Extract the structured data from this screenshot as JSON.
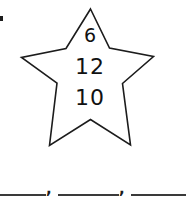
{
  "worksheet": {
    "background_color": "#ffffff",
    "ink_color": "#111111"
  },
  "star": {
    "shape": "five-pointed-star",
    "stroke_color": "#1c1c1c",
    "fill_color": "#ffffff",
    "numbers": [
      {
        "position": "top",
        "value": "6"
      },
      {
        "position": "middle",
        "value": "12"
      },
      {
        "position": "bottom",
        "value": "10"
      }
    ]
  },
  "answers": {
    "separator": ",",
    "blanks": [
      {
        "index": 1,
        "value": ""
      },
      {
        "index": 2,
        "value": ""
      },
      {
        "index": 3,
        "value": ""
      }
    ]
  },
  "marks": {
    "edge_mark": ""
  }
}
